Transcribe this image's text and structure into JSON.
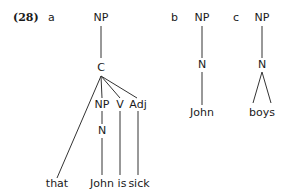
{
  "example_number": "(28)",
  "trees": {
    "a": {
      "label": "a",
      "nodes": {
        "root": "NP",
        "c": "C",
        "np": "NP",
        "v": "V",
        "adj": "Adj",
        "n": "N"
      },
      "leaves": {
        "that": "that",
        "john": "John",
        "is": "is",
        "sick": "sick"
      }
    },
    "b": {
      "label": "b",
      "nodes": {
        "root": "NP",
        "n": "N"
      },
      "leaves": {
        "john": "John"
      }
    },
    "c": {
      "label": "c",
      "nodes": {
        "root": "NP",
        "n": "N"
      },
      "leaves": {
        "boys": "boys"
      }
    }
  }
}
